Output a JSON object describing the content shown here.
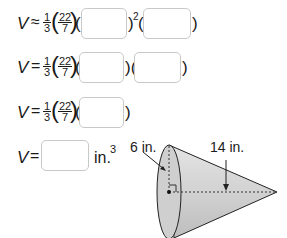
{
  "equations": [
    {
      "lhs": "V",
      "rel": "≈",
      "frac_num": "1",
      "frac_den": "3",
      "pi_num": "22",
      "pi_den": "7",
      "exponent": "2",
      "inputs": [
        {
          "value": ""
        },
        {
          "value": ""
        }
      ]
    },
    {
      "lhs": "V",
      "rel": "=",
      "frac_num": "1",
      "frac_den": "3",
      "pi_num": "22",
      "pi_den": "7",
      "inputs": [
        {
          "value": ""
        },
        {
          "value": ""
        }
      ]
    },
    {
      "lhs": "V",
      "rel": "=",
      "frac_num": "1",
      "frac_den": "3",
      "pi_num": "22",
      "pi_den": "7",
      "inputs": [
        {
          "value": ""
        }
      ]
    },
    {
      "lhs": "V",
      "rel": "=",
      "unit": "in.",
      "unit_exp": "3",
      "inputs": [
        {
          "value": ""
        }
      ]
    }
  ],
  "figure": {
    "shape": "cone",
    "radius_label": "6 in.",
    "height_label": "14 in."
  }
}
